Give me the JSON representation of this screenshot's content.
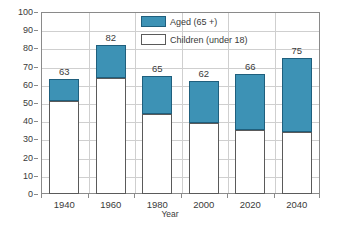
{
  "chart_data": {
    "type": "bar",
    "subtype": "stacked-vertical",
    "title": "",
    "xlabel": "Year",
    "ylabel": "",
    "ylim": [
      0,
      100
    ],
    "ytick_step": 10,
    "yticks": [
      "100",
      "90",
      "80",
      "70",
      "60",
      "50",
      "40",
      "30",
      "20",
      "10",
      "0"
    ],
    "grid": "horizontal-and-vertical",
    "legend_position": "inside-top-right",
    "categories": [
      "1940",
      "1960",
      "1980",
      "2000",
      "2020",
      "2040"
    ],
    "series": [
      {
        "name": "Children (under 18)",
        "color": "#ffffff",
        "values": [
          51,
          64,
          44,
          39,
          35,
          34
        ]
      },
      {
        "name": "Aged (65 +)",
        "color": "#3d92b5",
        "values": [
          12,
          18,
          21,
          23,
          31,
          41
        ]
      }
    ],
    "totals": [
      63,
      82,
      65,
      62,
      66,
      75
    ],
    "total_labels": [
      "63",
      "82",
      "65",
      "62",
      "66",
      "75"
    ],
    "annotations": []
  },
  "legend": {
    "entries": [
      {
        "label": "Aged (65 +)",
        "swatch": "aged"
      },
      {
        "label": "Children (under 18)",
        "swatch": "children"
      }
    ]
  },
  "colors": {
    "aged_fill": "#3d92b5",
    "aged_stroke": "#1f5f7d",
    "children_fill": "#ffffff",
    "children_stroke": "#5a5a5a",
    "grid": "#cfcfcf",
    "axis": "#8a8a8a",
    "text": "#3a3a3a",
    "background": "#ffffff"
  }
}
